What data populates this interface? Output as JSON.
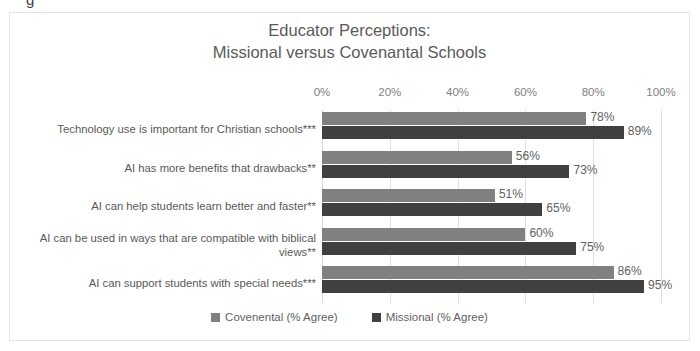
{
  "clipped_text_above": "g",
  "chart_data": {
    "type": "bar",
    "orientation": "horizontal",
    "title": "Educator Perceptions:\nMissional versus Covenantal Schools",
    "title_lines": [
      "Educator Perceptions:",
      "Missional versus Covenantal Schools"
    ],
    "xlabel": "",
    "ylabel": "",
    "xlim": [
      0,
      100
    ],
    "xticks": [
      0,
      20,
      40,
      60,
      80,
      100
    ],
    "xtick_labels": [
      "0%",
      "20%",
      "40%",
      "60%",
      "80%",
      "100%"
    ],
    "grid": true,
    "legend_position": "bottom",
    "categories": [
      "Technology use is important for Christian schools***",
      "AI has more benefits that drawbacks**",
      "AI can help students learn better and faster**",
      "AI can be used in ways that are compatible with biblical views**",
      "AI can support students with special needs***"
    ],
    "series": [
      {
        "name": "Covenental (% Agree)",
        "color": "#808080",
        "values": [
          78,
          56,
          51,
          60,
          86
        ],
        "labels": [
          "78%",
          "56%",
          "51%",
          "60%",
          "86%"
        ]
      },
      {
        "name": "Missional (% Agree)",
        "color": "#404040",
        "values": [
          89,
          73,
          65,
          75,
          95
        ],
        "labels": [
          "89%",
          "73%",
          "65%",
          "75%",
          "95%"
        ]
      }
    ]
  }
}
